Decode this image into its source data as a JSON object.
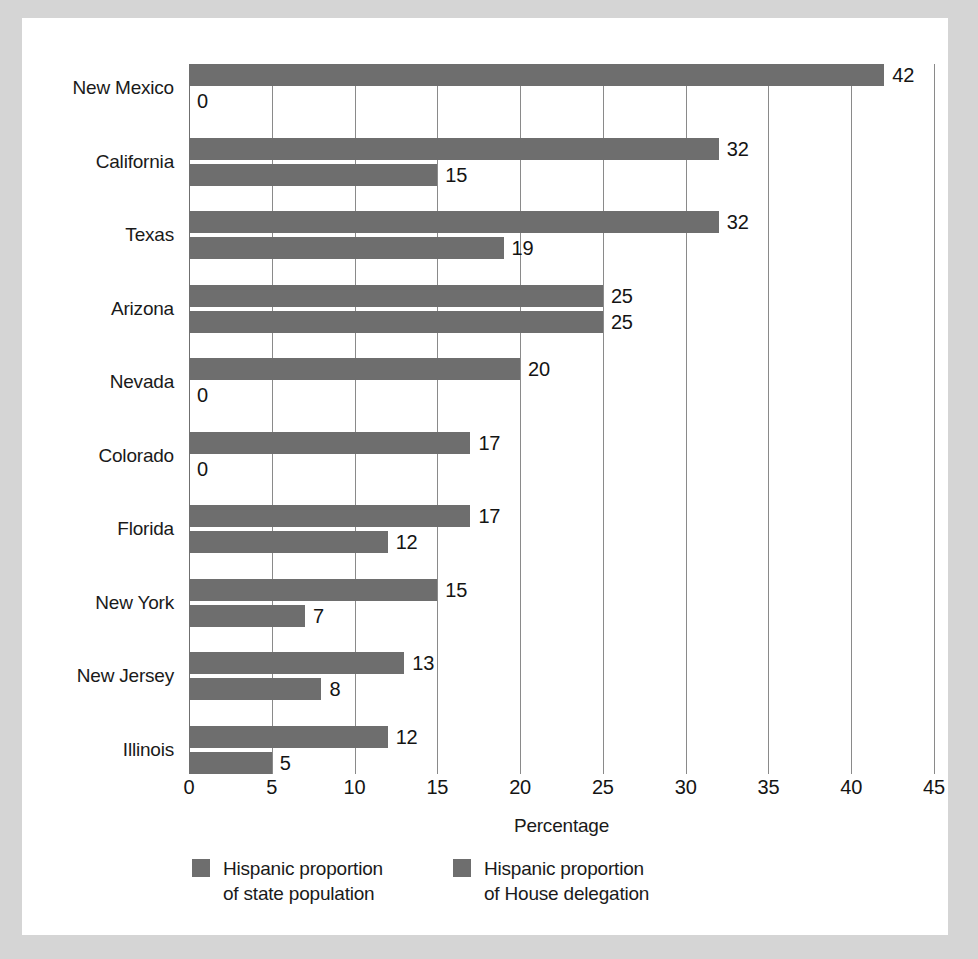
{
  "chart_data": {
    "type": "bar",
    "orientation": "horizontal",
    "title": "",
    "xlabel": "Percentage",
    "ylabel": "",
    "xlim": [
      0,
      45
    ],
    "xticks": [
      0,
      5,
      10,
      15,
      20,
      25,
      30,
      35,
      40,
      45
    ],
    "xtick_labels": [
      "0",
      "5",
      "10",
      "15",
      "20",
      "25",
      "30",
      "35",
      "40",
      "45"
    ],
    "grid": true,
    "grid_axis": "x",
    "legend_position": "bottom",
    "bar_color": "#6e6e6e",
    "categories": [
      "New Mexico",
      "California",
      "Texas",
      "Arizona",
      "Nevada",
      "Colorado",
      "Florida",
      "New York",
      "New Jersey",
      "Illinois"
    ],
    "series": [
      {
        "name": "Hispanic proportion\nof state population",
        "values": [
          42,
          32,
          32,
          25,
          20,
          17,
          17,
          15,
          13,
          12
        ],
        "labels": [
          "42",
          "32",
          "32",
          "25",
          "20",
          "17",
          "17",
          "15",
          "13",
          "12"
        ]
      },
      {
        "name": "Hispanic proportion\nof House delegation",
        "values": [
          0,
          15,
          19,
          25,
          0,
          0,
          12,
          7,
          8,
          5
        ],
        "labels": [
          "0",
          "15",
          "19",
          "25",
          "0",
          "0",
          "12",
          "7",
          "8",
          "5"
        ]
      }
    ]
  },
  "legend": {
    "items": [
      {
        "label": "Hispanic proportion\nof state population",
        "color": "#6e6e6e"
      },
      {
        "label": "Hispanic proportion\nof House delegation",
        "color": "#6e6e6e"
      }
    ]
  },
  "axis": {
    "x_title": "Percentage"
  },
  "colors": {
    "bar": "#6e6e6e",
    "grid": "#8a8a8a",
    "text": "#141414",
    "card": "#ffffff",
    "page": "#d5d5d5"
  }
}
